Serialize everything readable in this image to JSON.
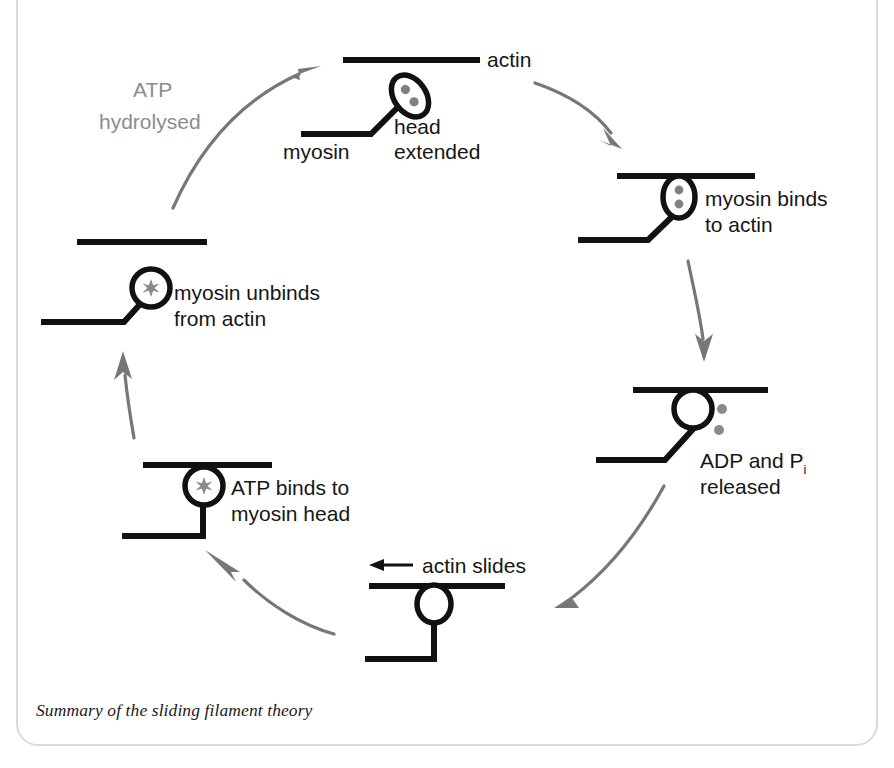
{
  "figure": {
    "caption": "Summary of the sliding filament theory",
    "colors": {
      "ink": "#111111",
      "arrow_gray": "#777777",
      "text_gray": "#8c8c8c",
      "frame": "#d9dada",
      "background": "#ffffff"
    }
  },
  "diagram": {
    "type": "cycle",
    "title": "Summary of the sliding filament theory",
    "step_count": 6,
    "direction": "clockwise",
    "steps": [
      {
        "id": "head-extended",
        "position": "top",
        "label_lines": [
          "head",
          "extended"
        ],
        "extra_labels": [
          "actin",
          "myosin"
        ],
        "head_state": "tilted-ellipse",
        "head_contents": "two dots",
        "bound_to_actin": false
      },
      {
        "id": "myosin-binds",
        "position": "right-upper",
        "label_lines": [
          "myosin binds",
          "to actin"
        ],
        "head_state": "upright-ellipse",
        "head_contents": "two dots",
        "bound_to_actin": true
      },
      {
        "id": "adp-pi-released",
        "position": "right-lower",
        "label_lines": [
          "ADP and P",
          "released"
        ],
        "label_subscript": "i",
        "head_state": "circle",
        "head_contents": "empty",
        "released_particles": 2,
        "bound_to_actin": true
      },
      {
        "id": "actin-slides",
        "position": "bottom",
        "label_lines": [
          "actin slides"
        ],
        "arrow_direction": "left",
        "head_state": "circle",
        "head_contents": "empty",
        "bound_to_actin": true
      },
      {
        "id": "atp-binds",
        "position": "left-lower",
        "label_lines": [
          "ATP binds to",
          "myosin head"
        ],
        "head_state": "circle",
        "head_contents": "atp-star",
        "bound_to_actin": true
      },
      {
        "id": "myosin-unbinds",
        "position": "left-upper",
        "label_lines": [
          "myosin unbinds",
          "from actin"
        ],
        "head_state": "circle",
        "head_contents": "atp-star",
        "bound_to_actin": false
      }
    ],
    "transition_labels": [
      {
        "id": "atp-hydrolysed",
        "lines": [
          "ATP",
          "hydrolysed"
        ],
        "color": "#8c8c8c",
        "between": [
          "myosin-unbinds",
          "head-extended"
        ]
      }
    ],
    "annotations": {
      "actin": "actin",
      "myosin": "myosin",
      "head": "head",
      "extended": "extended",
      "myosin_binds_1": "myosin binds",
      "myosin_binds_2": "to actin",
      "adp_pi_1": "ADP and P",
      "adp_pi_sub": "i",
      "adp_pi_2": "released",
      "actin_slides": "actin slides",
      "atp_binds_1": "ATP binds to",
      "atp_binds_2": "myosin head",
      "unbinds_1": "myosin unbinds",
      "unbinds_2": "from actin",
      "atp_hydrolysed_1": "ATP",
      "atp_hydrolysed_2": "hydrolysed"
    }
  }
}
